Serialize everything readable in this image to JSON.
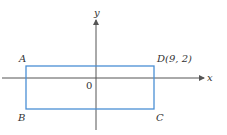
{
  "figure": {
    "axes": {
      "x_label": "x",
      "y_label": "y",
      "origin_label": "0",
      "axis_color": "#555555"
    },
    "rectangle": {
      "stroke_color": "#4a8fd4",
      "vertices": {
        "A": {
          "label": "A"
        },
        "B": {
          "label": "B"
        },
        "C": {
          "label": "C"
        },
        "D": {
          "label": "D(9, 2)",
          "coords": [
            9,
            2
          ]
        }
      }
    }
  }
}
